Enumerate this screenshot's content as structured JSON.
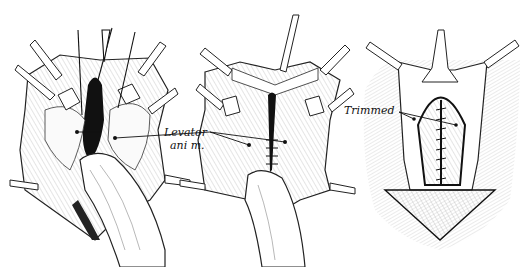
{
  "figure": {
    "panel_count": 3,
    "panels": [
      {
        "id": "left",
        "description": "retracted wound with finger inserted, levator ani exposed"
      },
      {
        "id": "middle",
        "description": "levator ani muscles approximated with sutures, finger inserted"
      },
      {
        "id": "right",
        "description": "closed repair with trimmed edges and continuous suture"
      }
    ],
    "labels": {
      "levator_line1": "Levator",
      "levator_line2": "ani m.",
      "trimmed": "Trimmed"
    },
    "colors": {
      "ink": "#111111",
      "background": "#ffffff",
      "shade": "#555555"
    }
  }
}
